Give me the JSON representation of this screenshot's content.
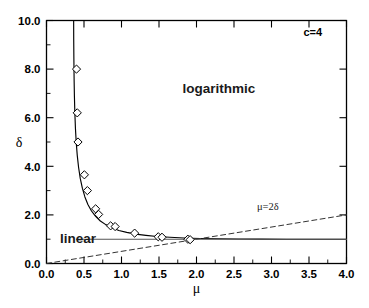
{
  "chart_data": {
    "type": "line",
    "title": "",
    "xlabel": "μ",
    "ylabel": "δ",
    "xlim": [
      0.0,
      4.0
    ],
    "ylim": [
      0.0,
      10.0
    ],
    "grid": false,
    "legend": "none",
    "xticks": [
      "0.0",
      "0.5",
      "1.0",
      "1.5",
      "2.0",
      "2.5",
      "3.0",
      "3.5",
      "4.0"
    ],
    "xtick_values": [
      0.0,
      0.5,
      1.0,
      1.5,
      2.0,
      2.5,
      3.0,
      3.5,
      4.0
    ],
    "yticks": [
      "0.0",
      "2.0",
      "4.0",
      "6.0",
      "8.0",
      "10.0"
    ],
    "ytick_values": [
      0.0,
      2.0,
      4.0,
      6.0,
      8.0,
      10.0
    ],
    "yminor_values": [
      1.0,
      3.0,
      5.0,
      7.0,
      9.0
    ],
    "annotations": [
      {
        "name": "parameter-annotation",
        "text": "c=4",
        "x": 3.55,
        "y": 9.35
      },
      {
        "name": "logarithmic-region-label",
        "text": "logarithmic",
        "x": 2.3,
        "y": 7.0
      },
      {
        "name": "linear-region-label",
        "text": "linear",
        "x": 0.42,
        "y": 0.85
      },
      {
        "name": "mu-equals-2delta-label",
        "text": "μ=2δ",
        "x": 2.95,
        "y": 2.22
      }
    ],
    "series": [
      {
        "name": "phase-boundary-curve",
        "style": "solid",
        "color": "#000000",
        "points": [
          [
            0.362,
            10.0
          ],
          [
            0.363,
            9.2
          ],
          [
            0.365,
            8.4
          ],
          [
            0.368,
            7.6
          ],
          [
            0.372,
            6.9
          ],
          [
            0.378,
            6.2
          ],
          [
            0.386,
            5.55
          ],
          [
            0.396,
            5.0
          ],
          [
            0.41,
            4.45
          ],
          [
            0.428,
            3.95
          ],
          [
            0.45,
            3.5
          ],
          [
            0.478,
            3.1
          ],
          [
            0.512,
            2.74
          ],
          [
            0.552,
            2.43
          ],
          [
            0.6,
            2.16
          ],
          [
            0.655,
            1.94
          ],
          [
            0.718,
            1.75
          ],
          [
            0.79,
            1.6
          ],
          [
            0.872,
            1.47
          ],
          [
            0.965,
            1.36
          ],
          [
            1.07,
            1.28
          ],
          [
            1.19,
            1.21
          ],
          [
            1.325,
            1.16
          ],
          [
            1.475,
            1.11
          ],
          [
            1.645,
            1.08
          ],
          [
            1.835,
            1.05
          ],
          [
            2.05,
            1.03
          ],
          [
            2.29,
            1.02
          ],
          [
            2.56,
            1.01
          ],
          [
            2.86,
            1.005
          ],
          [
            3.2,
            1.0
          ],
          [
            3.58,
            1.0
          ],
          [
            4.0,
            1.0
          ]
        ]
      },
      {
        "name": "mu-equals-2delta-line",
        "style": "dashed",
        "color": "#333333",
        "points": [
          [
            0.0,
            0.0
          ],
          [
            4.0,
            2.0
          ]
        ]
      },
      {
        "name": "delta-equals-one-asymptote",
        "style": "solid",
        "color": "#555555",
        "points": [
          [
            0.4,
            1.0
          ],
          [
            4.0,
            1.0
          ]
        ]
      }
    ],
    "scatter": {
      "name": "numerical-data-points",
      "marker": "diamond-open",
      "color": "#000000",
      "points": [
        [
          0.4,
          8.0
        ],
        [
          0.41,
          6.2
        ],
        [
          0.42,
          5.0
        ],
        [
          0.505,
          3.65
        ],
        [
          0.545,
          3.0
        ],
        [
          0.655,
          2.25
        ],
        [
          0.695,
          2.02
        ],
        [
          0.855,
          1.55
        ],
        [
          0.915,
          1.52
        ],
        [
          1.175,
          1.25
        ],
        [
          1.49,
          1.1
        ],
        [
          1.54,
          1.08
        ],
        [
          1.885,
          1.0
        ],
        [
          1.915,
          0.98
        ]
      ]
    }
  }
}
